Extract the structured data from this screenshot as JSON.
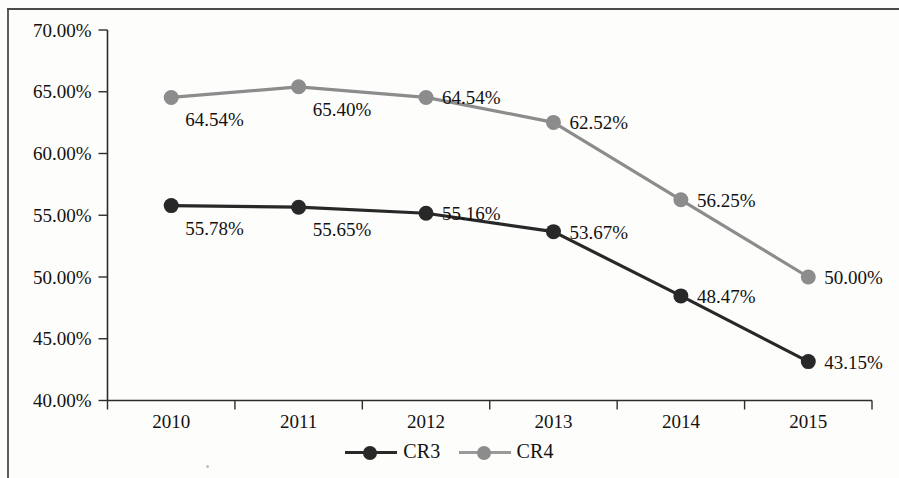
{
  "chart_data": {
    "type": "line",
    "title": "",
    "subtitle": "",
    "xlabel": "",
    "ylabel": "",
    "categories": [
      "2010",
      "2011",
      "2012",
      "2013",
      "2014",
      "2015"
    ],
    "ylim": [
      40,
      70
    ],
    "yticks": [
      40,
      45,
      50,
      55,
      60,
      65,
      70
    ],
    "ytick_labels": [
      "40.00%",
      "45.00%",
      "50.00%",
      "55.00%",
      "60.00%",
      "65.00%",
      "70.00%"
    ],
    "grid": false,
    "legend_position": "bottom-center",
    "value_suffix": "%",
    "series": [
      {
        "name": "CR3",
        "color": "#282828",
        "marker": "circle",
        "values": [
          55.78,
          55.65,
          55.16,
          53.67,
          48.47,
          43.15
        ],
        "labels": [
          "55.78%",
          "55.65%",
          "55.16%",
          "53.67%",
          "48.47%",
          "43.15%"
        ]
      },
      {
        "name": "CR4",
        "color": "#8c8c8c",
        "marker": "circle",
        "values": [
          64.54,
          65.4,
          64.54,
          62.52,
          56.25,
          50.0
        ],
        "labels": [
          "64.54%",
          "65.40%",
          "64.54%",
          "62.52%",
          "56.25%",
          "50.00%"
        ]
      }
    ]
  },
  "legend": {
    "items": [
      {
        "label": "CR3",
        "color": "#282828"
      },
      {
        "label": "CR4",
        "color": "#8c8c8c"
      }
    ]
  },
  "axes": {
    "y_tick_labels": [
      "70.00%",
      "65.00%",
      "60.00%",
      "55.00%",
      "50.00%",
      "45.00%",
      "40.00%"
    ],
    "x_tick_labels": [
      "2010",
      "2011",
      "2012",
      "2013",
      "2014",
      "2015"
    ]
  }
}
